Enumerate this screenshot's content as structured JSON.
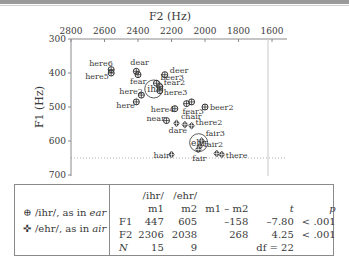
{
  "chart_data": {
    "type": "scatter",
    "title": "",
    "xlabel": "F2 (Hz)",
    "ylabel": "F1 (Hz)",
    "x_axis": {
      "position": "top",
      "reversed": true,
      "ticks": [
        2800,
        2600,
        2400,
        2200,
        2000,
        1800,
        1600
      ],
      "range": [
        2800,
        1600
      ]
    },
    "y_axis": {
      "reversed": true,
      "ticks": [
        300,
        400,
        500,
        600,
        700
      ],
      "range": [
        300,
        700
      ]
    },
    "grid": false,
    "reference_line": {
      "type": "dotted-horizontal",
      "y": 650
    },
    "series": [
      {
        "name": "/ihr/, as in ear",
        "marker": "circle-plus",
        "points": [
          {
            "label": "here6",
            "x": 2560,
            "y": 390
          },
          {
            "label": "here5",
            "x": 2560,
            "y": 400
          },
          {
            "label": "dear",
            "x": 2410,
            "y": 395
          },
          {
            "label": "fear",
            "x": 2400,
            "y": 405
          },
          {
            "label": "deer",
            "x": 2240,
            "y": 405
          },
          {
            "label": "beer3",
            "x": 2290,
            "y": 430
          },
          {
            "label": "fear2",
            "x": 2270,
            "y": 440
          },
          {
            "label": "here3",
            "x": 2270,
            "y": 452
          },
          {
            "label": "here2",
            "x": 2380,
            "y": 465
          },
          {
            "label": "here",
            "x": 2410,
            "y": 485
          },
          {
            "label": "here4",
            "x": 2180,
            "y": 505
          },
          {
            "label": "fear3",
            "x": 2110,
            "y": 490
          },
          {
            "label": "beer2",
            "x": 2000,
            "y": 500
          },
          {
            "label": "near",
            "x": 2230,
            "y": 540
          },
          {
            "label": "",
            "x": 2080,
            "y": 485
          }
        ],
        "mean": {
          "label": "ihr",
          "x": 2306,
          "y": 447
        }
      },
      {
        "name": "/ehr/, as in air",
        "marker": "diamond-plus",
        "points": [
          {
            "label": "dare",
            "x": 2170,
            "y": 548
          },
          {
            "label": "chair",
            "x": 2120,
            "y": 552
          },
          {
            "label": "there2",
            "x": 2080,
            "y": 555
          },
          {
            "label": "fair3",
            "x": 2020,
            "y": 600
          },
          {
            "label": "fair2",
            "x": 2030,
            "y": 615
          },
          {
            "label": "fair",
            "x": 2040,
            "y": 625
          },
          {
            "label": "hair",
            "x": 2200,
            "y": 640
          },
          {
            "label": "there",
            "x": 1900,
            "y": 640
          },
          {
            "label": "",
            "x": 1930,
            "y": 637
          }
        ],
        "mean": {
          "label": "ehr",
          "x": 2038,
          "y": 605
        }
      }
    ],
    "legend_position": "bottom-left"
  },
  "axes": {
    "x_title": "F2 (Hz)",
    "y_title": "F1 (Hz)",
    "x_ticks": [
      "2800",
      "2600",
      "2400",
      "2200",
      "2000",
      "1800",
      "1600"
    ],
    "y_ticks": [
      "300",
      "400",
      "500",
      "600",
      "700"
    ]
  },
  "legend": {
    "items": [
      {
        "symbol": "⊕",
        "text": "/ihr/, as in ",
        "word": "ear"
      },
      {
        "symbol": "✜",
        "text": "/ehr/, as in ",
        "word": "air"
      }
    ]
  },
  "stats_table": {
    "header_row1": [
      "",
      "/ihr/",
      "/ehr/",
      "",
      "",
      ""
    ],
    "header_row2": [
      "",
      "m1",
      "m2",
      "m1 – m2",
      "t",
      "p"
    ],
    "rows": [
      [
        "F1",
        "447",
        "605",
        "–158",
        "–7.80",
        "< .001"
      ],
      [
        "F2",
        "2306",
        "2038",
        "268",
        "4.25",
        "< .001"
      ],
      [
        "N",
        "15",
        "9",
        "",
        "df = 22",
        ""
      ]
    ]
  }
}
